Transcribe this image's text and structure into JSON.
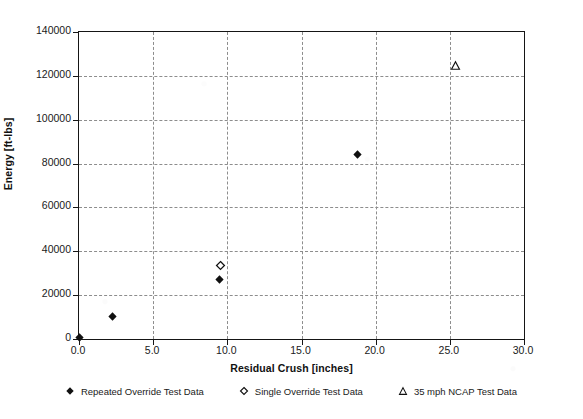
{
  "chart_data": {
    "type": "scatter",
    "title": "",
    "xlabel": "Residual Crush [inches]",
    "ylabel": "Energy [ft-lbs]",
    "xlim": [
      0.0,
      30.0
    ],
    "ylim": [
      0,
      140000
    ],
    "xticks": [
      "0.0",
      "5.0",
      "10.0",
      "15.0",
      "20.0",
      "25.0",
      "30.0"
    ],
    "xtick_values": [
      0,
      5,
      10,
      15,
      20,
      25,
      30
    ],
    "yticks": [
      "0",
      "20000",
      "40000",
      "60000",
      "80000",
      "100000",
      "120000",
      "140000"
    ],
    "ytick_values": [
      0,
      20000,
      40000,
      60000,
      80000,
      100000,
      120000,
      140000
    ],
    "grid": true,
    "legend_position": "below",
    "series": [
      {
        "name": "Repeated Override Test Data",
        "marker": "filled-diamond",
        "color": "#111111",
        "points": [
          {
            "x": 0.0,
            "y": 900
          },
          {
            "x": 2.25,
            "y": 10200
          },
          {
            "x": 9.5,
            "y": 27200
          },
          {
            "x": 18.75,
            "y": 84300
          }
        ]
      },
      {
        "name": "Single Override Test Data",
        "marker": "open-diamond",
        "color": "#111111",
        "points": [
          {
            "x": 9.55,
            "y": 33500
          }
        ]
      },
      {
        "name": "35 mph NCAP Test Data",
        "marker": "open-triangle",
        "color": "#111111",
        "points": [
          {
            "x": 25.4,
            "y": 124500
          }
        ]
      }
    ]
  },
  "legend": {
    "entries": [
      {
        "label": "Repeated Override Test Data",
        "marker": "filled-diamond"
      },
      {
        "label": "Single Override Test Data",
        "marker": "open-diamond"
      },
      {
        "label": "35 mph NCAP Test Data",
        "marker": "open-triangle"
      }
    ]
  },
  "colors": {
    "axis": "#151515",
    "grid": "#8d8d8d",
    "marker": "#111111",
    "background": "#ffffff"
  }
}
